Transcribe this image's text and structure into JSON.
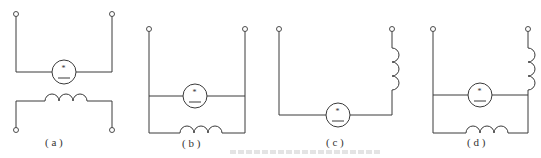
{
  "figure": {
    "panels": [
      {
        "id": "a",
        "label": "( a )",
        "description": "Motor armature and field winding separate (separately excited)"
      },
      {
        "id": "b",
        "label": "( b )",
        "description": "Field winding in parallel with armature (shunt)"
      },
      {
        "id": "c",
        "label": "( c )",
        "description": "Field winding in series with armature (series)"
      },
      {
        "id": "d",
        "label": "( d )",
        "description": "Series and shunt windings (compound)"
      }
    ],
    "armature_symbol": "*",
    "caption_visible": false
  }
}
